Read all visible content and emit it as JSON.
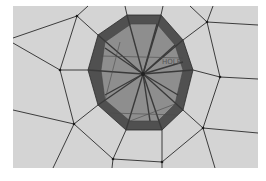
{
  "figure": {
    "type": "finite-element-mesh",
    "label": "HOLE",
    "colors": {
      "page_background": "#ffffff",
      "mesh_background": "#d4d4d4",
      "mesh_line": "#2a2a2a",
      "polygon_rim": "#505050",
      "polygon_fill": "#8e8e8e",
      "spoke": "#3a3a3a"
    },
    "viewport": {
      "x": 13,
      "y": 6,
      "width": 245,
      "height": 162
    },
    "hole": {
      "center": [
        143,
        74
      ],
      "outer_vertices": [
        [
          127,
          15
        ],
        [
          161,
          15
        ],
        [
          183,
          40
        ],
        [
          193,
          70
        ],
        [
          183,
          110
        ],
        [
          162,
          130
        ],
        [
          126,
          130
        ],
        [
          98,
          105
        ],
        [
          88,
          70
        ],
        [
          98,
          35
        ]
      ],
      "inner_vertices": [
        [
          131,
          24
        ],
        [
          157,
          24
        ],
        [
          175,
          45
        ],
        [
          183,
          70
        ],
        [
          175,
          104
        ],
        [
          158,
          121
        ],
        [
          130,
          121
        ],
        [
          105,
          100
        ],
        [
          101,
          70
        ],
        [
          105,
          42
        ]
      ]
    },
    "mesh_nodes": [
      {
        "id": "n1",
        "pos": [
          77,
          16
        ]
      },
      {
        "id": "n2",
        "pos": [
          207,
          22
        ]
      },
      {
        "id": "n3",
        "pos": [
          60,
          70
        ]
      },
      {
        "id": "n4",
        "pos": [
          220,
          77
        ]
      },
      {
        "id": "n5",
        "pos": [
          74,
          124
        ]
      },
      {
        "id": "n6",
        "pos": [
          203,
          128
        ]
      },
      {
        "id": "n7",
        "pos": [
          113,
          159
        ]
      },
      {
        "id": "n8",
        "pos": [
          162,
          162
        ]
      }
    ]
  }
}
